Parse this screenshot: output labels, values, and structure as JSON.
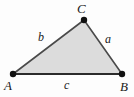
{
  "figure": {
    "type": "geometry-diagram",
    "shape": "triangle",
    "canvas": {
      "width": 134,
      "height": 97
    },
    "colors": {
      "background": "#fdfdfd",
      "fill": "#dcdcdc",
      "stroke": "#4a4a4a",
      "stroke_dark": "#2b2b2b",
      "vertex_dot": "#111111",
      "label": "#1a1a1a"
    },
    "vertices": [
      {
        "name": "A",
        "label": "A",
        "x": 13,
        "y": 74
      },
      {
        "name": "B",
        "label": "B",
        "x": 122,
        "y": 74
      },
      {
        "name": "C",
        "label": "C",
        "x": 84,
        "y": 20
      }
    ],
    "sides": [
      {
        "name": "a",
        "label": "a",
        "between": "B-C",
        "label_x": 109,
        "label_y": 39
      },
      {
        "name": "b",
        "label": "b",
        "between": "A-C",
        "label_x": 42,
        "label_y": 37
      },
      {
        "name": "c",
        "label": "c",
        "between": "A-B",
        "label_x": 67,
        "label_y": 85
      }
    ],
    "polygon_points": "13,74 84,20 122,74"
  }
}
